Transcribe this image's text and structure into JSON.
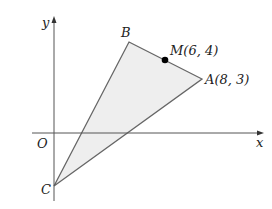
{
  "figure": {
    "type": "coordinate-geometry-triangle",
    "axes": {
      "x_label": "x",
      "y_label": "y",
      "origin_label": "O"
    },
    "points": {
      "A": {
        "label": "A(8, 3)",
        "x": 8,
        "y": 3
      },
      "B": {
        "label": "B"
      },
      "C": {
        "label": "C"
      },
      "M": {
        "label": "M(6, 4)",
        "x": 6,
        "y": 4,
        "note": "midpoint marked on segment AB"
      }
    },
    "colors": {
      "fill": "#eeeeee",
      "stroke": "#666666",
      "axis": "#555555",
      "point": "#000000"
    }
  }
}
